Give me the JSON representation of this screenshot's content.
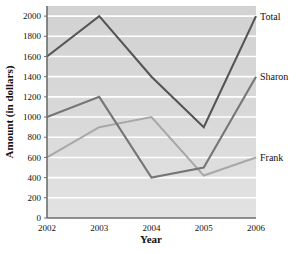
{
  "chart_data": {
    "type": "line",
    "title": "",
    "xlabel": "Year",
    "ylabel": "Amount (in dollars)",
    "categories": [
      "2002",
      "2003",
      "2004",
      "2005",
      "2006"
    ],
    "x": [
      2002,
      2003,
      2004,
      2005,
      2006
    ],
    "xlim": [
      2002,
      2006
    ],
    "ylim": [
      0,
      2100
    ],
    "yticks": [
      0,
      200,
      400,
      600,
      800,
      1000,
      1200,
      1400,
      1600,
      1800,
      2000
    ],
    "ytick_labels": [
      "0",
      "200",
      "400",
      "600",
      "800",
      "1000",
      "1200",
      "1400",
      "1600",
      "1800",
      "2000"
    ],
    "grid": true,
    "grid_color": "#ffffff",
    "plot_background": "#d5d5d5",
    "legend_position": "right-inline-labels",
    "series": [
      {
        "name": "Total",
        "label": "Total",
        "color": "#555555",
        "values": [
          1600,
          2000,
          1400,
          900,
          2000
        ]
      },
      {
        "name": "Sharon",
        "label": "Sharon",
        "color": "#767676",
        "values": [
          1000,
          1200,
          400,
          500,
          1400
        ]
      },
      {
        "name": "Frank",
        "label": "Frank",
        "color": "#a8a8a8",
        "values": [
          600,
          900,
          1000,
          420,
          600
        ]
      }
    ]
  },
  "axes": {
    "x_title": "Year",
    "y_title": "Amount (in dollars)"
  },
  "labels": {
    "total": "Total",
    "sharon": "Sharon",
    "frank": "Frank"
  }
}
